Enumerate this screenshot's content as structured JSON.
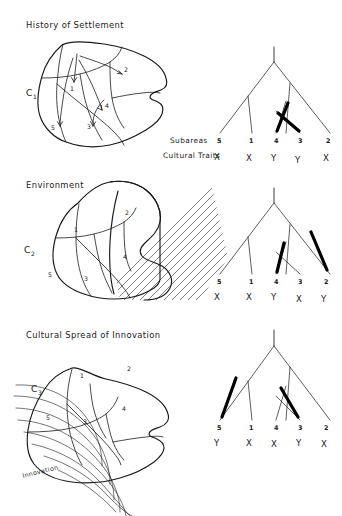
{
  "figure": {
    "background_color": "#ffffff",
    "ink_color": "#1a1a1a",
    "highlight_color": "#000000"
  },
  "panels": [
    {
      "id": "history-of-settlement",
      "title": "History of Settlement",
      "culture_label": "C",
      "culture_subscript": "1",
      "map": {
        "area_numbers": [
          "1",
          "2",
          "3",
          "4",
          "5"
        ],
        "has_arrows": true,
        "has_hatching": false,
        "has_waves": false
      },
      "tree": {
        "tip_numbers": [
          "5",
          "1",
          "4",
          "3",
          "2"
        ],
        "traits": [
          "X",
          "X",
          "Y",
          "Y",
          "X"
        ],
        "highlighted_tips": [
          "4",
          "3"
        ],
        "highlight_style": "thick-black-branch"
      },
      "row_labels": {
        "subareas": "Subareas",
        "cultural_traits": "Cultural Traits"
      }
    },
    {
      "id": "environment",
      "title": "Environment",
      "culture_label": "C",
      "culture_subscript": "2",
      "map": {
        "area_numbers": [
          "1",
          "2",
          "3",
          "4",
          "5"
        ],
        "has_arrows": false,
        "has_hatching": true,
        "has_waves": false,
        "hatched_areas": [
          "2",
          "4"
        ]
      },
      "tree": {
        "tip_numbers": [
          "5",
          "1",
          "4",
          "3",
          "2"
        ],
        "traits": [
          "X",
          "X",
          "Y",
          "X",
          "Y"
        ],
        "highlighted_tips": [
          "4",
          "2"
        ],
        "highlight_style": "thick-black-branch"
      }
    },
    {
      "id": "cultural-spread-of-innovation",
      "title": "Cultural Spread of Innovation",
      "culture_label": "C",
      "culture_subscript": "3",
      "map": {
        "area_numbers": [
          "1",
          "2",
          "3",
          "4",
          "5"
        ],
        "has_arrows": false,
        "has_hatching": false,
        "has_waves": true,
        "wave_source_label": "Innovation"
      },
      "tree": {
        "tip_numbers": [
          "5",
          "1",
          "4",
          "3",
          "2"
        ],
        "traits": [
          "Y",
          "X",
          "X",
          "Y",
          "X"
        ],
        "highlighted_tips": [
          "5",
          "3"
        ],
        "highlight_style": "thick-black-branch"
      }
    }
  ]
}
